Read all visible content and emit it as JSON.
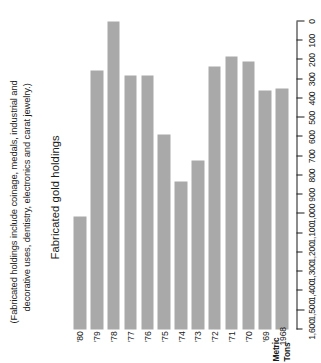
{
  "note": {
    "line1": "(Fabricated holdings include coinage, medals, industrial and",
    "line2": "decorative uses, dentistry, electronics and carat jewelry.)"
  },
  "axis_title": {
    "line1": "Metric",
    "line2": "Tons"
  },
  "chart_data": {
    "type": "bar",
    "orientation": "horizontal",
    "title": "Fabricated gold holdings",
    "xlabel": "",
    "ylabel": "Metric Tons",
    "grid": false,
    "legend": null,
    "value_axis": {
      "min": 0,
      "max": 1600,
      "step": 100,
      "tick_labels": [
        "1,600",
        "1,500",
        "1,400",
        "1,300",
        "1,200",
        "1,100",
        "1,000",
        "900",
        "800",
        "700",
        "600",
        "500",
        "400",
        "300",
        "200",
        "100",
        "0"
      ],
      "tick_values": [
        1600,
        1500,
        1400,
        1300,
        1200,
        1100,
        1000,
        900,
        800,
        700,
        600,
        500,
        400,
        300,
        200,
        100,
        0
      ]
    },
    "bar_color": "#a9a9a9",
    "categories": [
      "1968",
      "'69",
      "'70",
      "'71",
      "'72",
      "'73",
      "'74",
      "'75",
      "'76",
      "'77",
      "'78",
      "'79",
      "'80"
    ],
    "values": [
      1250,
      1240,
      1390,
      1420,
      1365,
      880,
      770,
      1015,
      1320,
      1320,
      1620,
      1345,
      585
    ],
    "series": [
      {
        "name": "Fabricated gold holdings",
        "values": [
          1250,
          1240,
          1390,
          1420,
          1365,
          880,
          770,
          1015,
          1320,
          1320,
          1620,
          1345,
          585
        ]
      }
    ]
  }
}
